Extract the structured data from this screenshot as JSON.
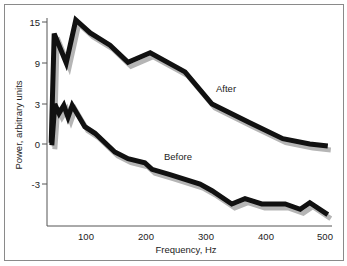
{
  "chart_data": {
    "type": "line",
    "title": "",
    "xlabel": "Frequency, Hz",
    "ylabel": "Power, arbitrary units",
    "xlim": [
      35,
      510
    ],
    "ylim": [
      -6,
      16
    ],
    "x_ticks": [
      100,
      200,
      300,
      400,
      500
    ],
    "y_ticks": [
      15,
      9,
      3,
      0,
      -3
    ],
    "grid": false,
    "legend": "none (inline annotations)",
    "annotations": [
      {
        "text": "After",
        "x": 337,
        "y": 5.4
      },
      {
        "text": "Before",
        "x": 253,
        "y": -0.9
      }
    ],
    "series": [
      {
        "name": "After",
        "color": "#111111",
        "shadow_color": "#b5b5b5",
        "x": [
          42,
          47,
          67,
          83,
          107,
          140,
          170,
          207,
          265,
          310,
          373,
          428,
          473,
          503
        ],
        "y": [
          0.1,
          13.3,
          9.0,
          15.3,
          13.4,
          11.6,
          9.1,
          10.5,
          7.7,
          3.0,
          1.6,
          0.4,
          0.0,
          -0.15
        ]
      },
      {
        "name": "Before",
        "color": "#111111",
        "shadow_color": "#b5b5b5",
        "x": [
          43,
          48,
          55,
          63,
          70,
          77,
          98,
          115,
          148,
          170,
          198,
          210,
          240,
          290,
          310,
          343,
          365,
          393,
          432,
          457,
          473,
          503
        ],
        "y": [
          -0.1,
          3.0,
          2.3,
          2.9,
          2.0,
          2.9,
          1.3,
          0.8,
          -0.6,
          -1.1,
          -1.4,
          -1.9,
          -2.3,
          -3.0,
          -3.5,
          -4.5,
          -4.1,
          -4.5,
          -4.5,
          -4.9,
          -4.4,
          -5.3
        ]
      }
    ]
  },
  "labels": {
    "x_axis_title": "Frequency, Hz",
    "y_axis_title": "Power, arbitrary units",
    "after": "After",
    "before": "Before",
    "x_ticks": [
      "100",
      "200",
      "300",
      "400",
      "500"
    ],
    "y_ticks": [
      "15",
      "9",
      "3",
      "0",
      "-3"
    ]
  }
}
